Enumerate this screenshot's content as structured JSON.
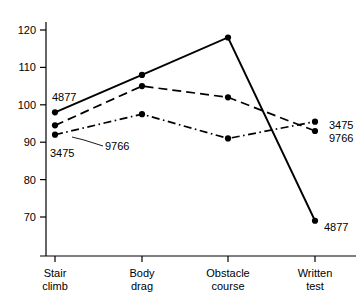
{
  "chart_data": {
    "type": "line",
    "title": "",
    "xlabel": "",
    "ylabel": "",
    "categories": [
      "Stair climb",
      "Body drag",
      "Obstacle course",
      "Written test"
    ],
    "category_lines": [
      [
        "Stair",
        "climb"
      ],
      [
        "Body",
        "drag"
      ],
      [
        "Obstacle",
        "course"
      ],
      [
        "Written",
        "test"
      ]
    ],
    "ylim": [
      70,
      120
    ],
    "yticks": [
      70,
      80,
      90,
      100,
      110,
      120
    ],
    "ytick_labels": [
      "70",
      "80",
      "90",
      "100",
      "110",
      "120"
    ],
    "grid": false,
    "legend_position": "inline-endpoint-labels",
    "series": [
      {
        "name": "4877",
        "style": "solid",
        "marker": "filled-circle",
        "color": "#000000",
        "values": [
          98,
          108,
          118,
          69
        ]
      },
      {
        "name": "9766",
        "style": "dashed",
        "marker": "filled-circle",
        "color": "#000000",
        "values": [
          94.5,
          105,
          102,
          93
        ]
      },
      {
        "name": "3475",
        "style": "dash-dot",
        "marker": "filled-circle",
        "color": "#000000",
        "values": [
          92,
          97.5,
          91,
          95.5
        ]
      }
    ],
    "annotations": [
      {
        "text": "4877",
        "anchor": "start-of-solid-series",
        "side": "left"
      },
      {
        "text": "9766",
        "anchor": "start-of-dashed-series",
        "side": "right-with-leader"
      },
      {
        "text": "3475",
        "anchor": "start-of-dashdot-series",
        "side": "below-left"
      },
      {
        "text": "3475",
        "anchor": "end-of-dashdot-series",
        "side": "right"
      },
      {
        "text": "9766",
        "anchor": "end-of-dashed-series",
        "side": "right"
      },
      {
        "text": "4877",
        "anchor": "end-of-solid-series",
        "side": "right"
      }
    ]
  }
}
